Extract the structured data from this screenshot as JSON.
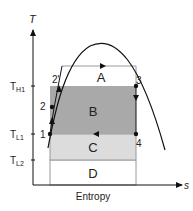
{
  "axes": {
    "y_label": "T",
    "x_label": "s",
    "x_caption": "Entropy"
  },
  "temperature_levels": {
    "th1": {
      "main": "T",
      "sub": "H1"
    },
    "tl1": {
      "main": "T",
      "sub": "L1"
    },
    "tl2": {
      "main": "T",
      "sub": "L2"
    }
  },
  "regions": {
    "a": "A",
    "b": "B",
    "c": "C",
    "d": "D"
  },
  "points": {
    "p1": "1",
    "p2": "2",
    "p2prime": "2'",
    "p3": "3",
    "p4": "4"
  },
  "colors": {
    "region_b": "#a9a9a9",
    "region_c": "#dcdcdc",
    "line": "#111111",
    "box_border": "#9a9a9a"
  }
}
